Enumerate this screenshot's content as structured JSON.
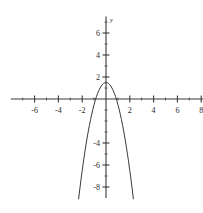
{
  "chart_data": {
    "type": "line",
    "title": "",
    "xlabel": "x",
    "ylabel": "y",
    "grid": false,
    "legend": "none",
    "xlim": [
      -8,
      8
    ],
    "ylim": [
      -9,
      7.5
    ],
    "x_ticks_major": [
      -6,
      -4,
      -2,
      2,
      4,
      6,
      8
    ],
    "x_tick_labels": [
      "-6",
      "-4",
      "-2",
      "2",
      "4",
      "6",
      "8"
    ],
    "x_ticks_minor": [
      -7,
      -5,
      -3,
      -1,
      1,
      3,
      5,
      7
    ],
    "y_ticks_major": [
      6,
      4,
      2,
      -4,
      -6,
      -8
    ],
    "y_tick_labels": [
      "6",
      "4",
      "2",
      "-4",
      "-6",
      "-8"
    ],
    "y_ticks_minor": [
      7,
      5,
      3,
      1,
      -1,
      -2,
      -3,
      -5,
      -7
    ],
    "curve": {
      "name": "parabola",
      "equation": "y = -2x^2 + 1.5",
      "vertex": [
        0,
        1.5
      ],
      "x_intercepts": [
        -0.87,
        0.87
      ],
      "y_intercept": 1.5,
      "opens": "down",
      "color": "#3a3a3a",
      "x": [
        -2.3,
        -2.2,
        -2.1,
        -2.0,
        -1.9,
        -1.8,
        -1.7,
        -1.6,
        -1.5,
        -1.4,
        -1.3,
        -1.2,
        -1.1,
        -1.0,
        -0.9,
        -0.8,
        -0.7,
        -0.6,
        -0.5,
        -0.4,
        -0.3,
        -0.2,
        -0.1,
        0,
        0.1,
        0.2,
        0.3,
        0.4,
        0.5,
        0.6,
        0.7,
        0.8,
        0.9,
        1.0,
        1.1,
        1.2,
        1.3,
        1.4,
        1.5,
        1.6,
        1.7,
        1.8,
        1.9,
        2.0,
        2.1,
        2.2,
        2.3
      ],
      "y": [
        -9.08,
        -8.18,
        -7.32,
        -6.5,
        -5.72,
        -4.98,
        -4.28,
        -3.62,
        -3.0,
        -2.42,
        -1.88,
        -1.38,
        -0.92,
        -0.5,
        -0.12,
        0.22,
        0.52,
        0.78,
        1.0,
        1.18,
        1.32,
        1.42,
        1.48,
        1.5,
        1.48,
        1.42,
        1.32,
        1.18,
        1.0,
        0.78,
        0.52,
        0.22,
        -0.12,
        -0.5,
        -0.92,
        -1.38,
        -1.88,
        -2.42,
        -3.0,
        -3.62,
        -4.28,
        -4.98,
        -5.72,
        -6.5,
        -7.32,
        -8.18,
        -9.08
      ]
    },
    "axes": {
      "x_axis_label_position": "right-end",
      "y_axis_label_position": "top-end",
      "origin": [
        0,
        0
      ]
    }
  }
}
